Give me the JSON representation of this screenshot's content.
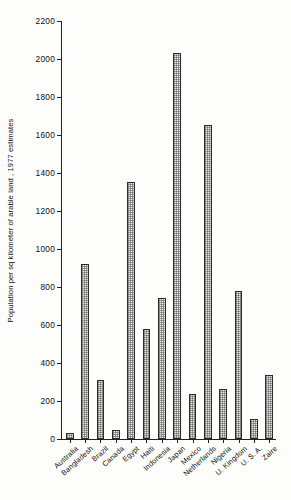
{
  "chart_data": {
    "type": "bar",
    "title": "",
    "xlabel": "",
    "ylabel": "Population per sq kilometer of arable land , 1977 estimates",
    "ylim": [
      0,
      2200
    ],
    "yticks": [
      0,
      200,
      400,
      600,
      800,
      1000,
      1200,
      1400,
      1600,
      1800,
      2000,
      2200
    ],
    "ytick_labels": [
      "0",
      "200",
      "400",
      "600",
      "800",
      "1000",
      "1200",
      "1400",
      "1600",
      "1800",
      "2000",
      "2200"
    ],
    "grid": false,
    "legend": null,
    "categories": [
      "Australia",
      "Bangladesh",
      "Brazil",
      "Canada",
      "Egypt",
      "Haiti",
      "Indonesia",
      "Japan",
      "Mexico",
      "Netherlands",
      "Nigeria",
      "U. Kingdom",
      "U. S. A.",
      "Zaire"
    ],
    "values": [
      30,
      920,
      310,
      50,
      1355,
      580,
      740,
      2030,
      235,
      1655,
      265,
      780,
      105,
      335
    ],
    "bar_fill_color": "#e9e9e9",
    "bar_edge_color": "#2b2b2b",
    "bar_pattern": "fine-dotted-hatch",
    "background_color": "#fdfdfc",
    "axis_color": "#222222"
  }
}
